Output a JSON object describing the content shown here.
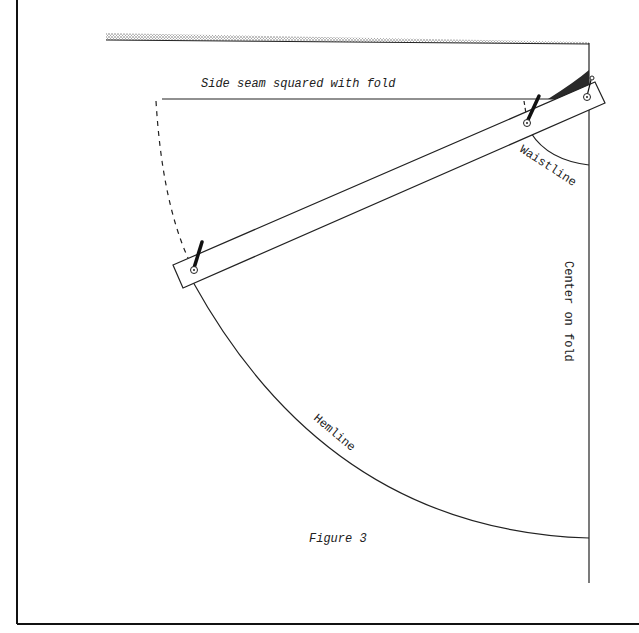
{
  "figure": {
    "caption": "Figure 3",
    "labels": {
      "side_seam": "Side seam squared with fold",
      "waistline": "Waistline",
      "center_fold": "Center on fold",
      "hemline": "Hemline"
    }
  },
  "colors": {
    "line": "#1a1a1a",
    "shade": "#2a2a2a",
    "stipple": "#555555",
    "background": "#ffffff"
  }
}
